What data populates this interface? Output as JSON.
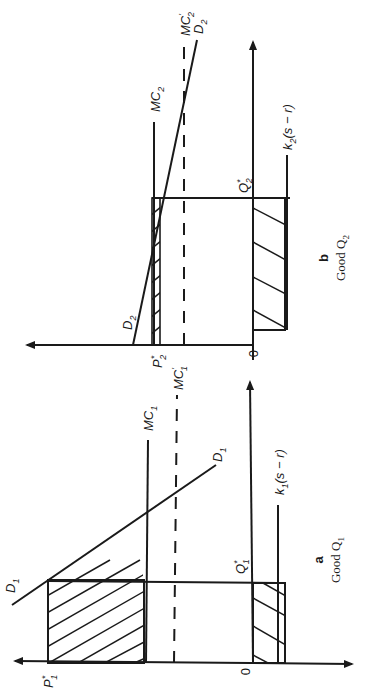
{
  "figure": {
    "orientation": "rotated 90 degrees counter-clockwise",
    "panels": [
      {
        "id": "a",
        "letter": "a",
        "caption": "Good Q",
        "caption_sub": "1",
        "price_axis_label": "P",
        "price_axis_label_sub": "1",
        "price_axis_label_sup": "*",
        "origin_label": "0",
        "quantity_label": "Q",
        "quantity_label_sub": "1",
        "quantity_label_sup": "*",
        "curves": {
          "mc": {
            "label": "MC",
            "sub": "1",
            "style": "solid"
          },
          "mc_prime": {
            "label": "MC",
            "sub": "1",
            "prime": "'",
            "style": "dashed"
          },
          "demand": {
            "label": "D",
            "sub": "1"
          },
          "cost_line": {
            "label": "k",
            "sub": "1",
            "rest": "(s − r)"
          }
        }
      },
      {
        "id": "b",
        "letter": "b",
        "caption": "Good Q",
        "caption_sub": "2",
        "price_axis_label": "P",
        "price_axis_label_sub": "2",
        "price_axis_label_sup": "*",
        "origin_label": "0",
        "quantity_label": "Q",
        "quantity_label_sub": "2",
        "quantity_label_sup": "*",
        "curves": {
          "mc": {
            "label": "MC",
            "sub": "2",
            "style": "solid"
          },
          "mc_prime": {
            "label": "MC",
            "sub": "2",
            "prime": "'",
            "style": "dashed"
          },
          "demand_top": {
            "label": "D",
            "sub": "2"
          },
          "demand_bottom": {
            "label": "D",
            "sub": "2"
          },
          "cost_line": {
            "label": "k",
            "sub": "2",
            "rest": "(s − r)"
          }
        }
      }
    ]
  }
}
